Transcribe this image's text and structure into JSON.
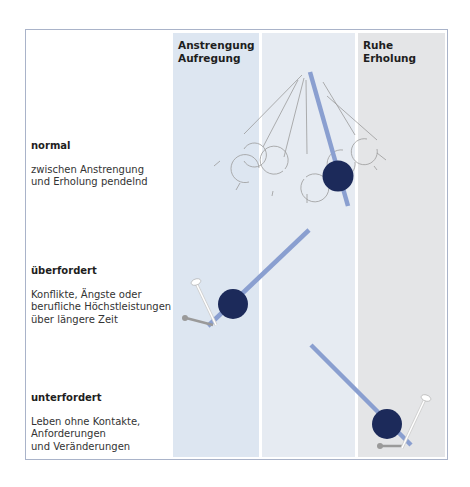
{
  "columns": [
    {
      "id": "anstrengung",
      "line1": "Anstrengung",
      "line2": "Aufregung",
      "color": "#dde6f1"
    },
    {
      "id": "mitte",
      "line1": "",
      "line2": "",
      "color": "#e6ebf2"
    },
    {
      "id": "ruhe",
      "line1": "Ruhe",
      "line2": "Erholung",
      "color": "#e4e5e7"
    }
  ],
  "states": [
    {
      "id": "normal",
      "title": "normal",
      "desc": "zwischen Anstrengung\nund Erholung pendelnd"
    },
    {
      "id": "ueberfordert",
      "title": "überfordert",
      "desc": "Konflikte, Ängste oder\nberufliche Höchstleistungen\nüber längere Zeit"
    },
    {
      "id": "unterfordert",
      "title": "unterfordert",
      "desc": "Leben ohne Kontakte,\nAnforderungen\nund Veränderungen"
    }
  ],
  "colors": {
    "rod": "#8a9fd0",
    "bob": "#1c2a5a",
    "ghost": "#9a9a9a",
    "frame": "#a9b3c9"
  }
}
